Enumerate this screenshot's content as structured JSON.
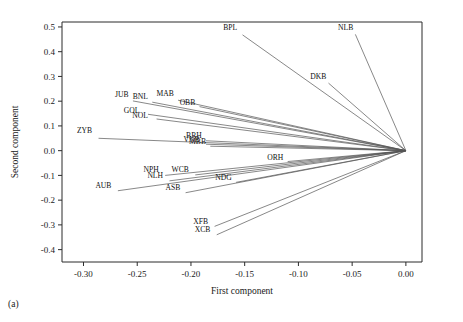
{
  "figure": {
    "panel_label": "(a)"
  },
  "chart_data": {
    "type": "scatter",
    "subtype": "pca-loading-biplot",
    "title": "",
    "xlabel": "First component",
    "ylabel": "Second component",
    "xlim": [
      -0.32,
      0.015
    ],
    "ylim": [
      -0.45,
      0.52
    ],
    "grid": false,
    "legend": null,
    "origin": [
      0.0,
      0.0
    ],
    "xticks": [
      "-0.30",
      "-0.25",
      "-0.20",
      "-0.15",
      "-0.10",
      "-0.05",
      "0.00"
    ],
    "xtickvalues": [
      -0.3,
      -0.25,
      -0.2,
      -0.15,
      -0.1,
      -0.05,
      0.0
    ],
    "yticks": [
      "0.5",
      "0.4",
      "0.3",
      "0.2",
      "0.1",
      "0.0",
      "-0.1",
      "-0.2",
      "-0.3",
      "-0.4"
    ],
    "ytickvalues": [
      0.5,
      0.4,
      0.3,
      0.2,
      0.1,
      0.0,
      -0.1,
      -0.2,
      -0.3,
      -0.4
    ],
    "points": [
      {
        "label": "BPL",
        "x": -0.152,
        "y": 0.468,
        "lx": -0.157,
        "ly": 0.487
      },
      {
        "label": "NLB",
        "x": -0.047,
        "y": 0.47,
        "lx": -0.049,
        "ly": 0.489
      },
      {
        "label": "DKB",
        "x": -0.072,
        "y": 0.273,
        "lx": -0.074,
        "ly": 0.29
      },
      {
        "label": "JUB",
        "x": -0.254,
        "y": 0.201,
        "lx": -0.258,
        "ly": 0.218
      },
      {
        "label": "BNL",
        "x": -0.236,
        "y": 0.196,
        "lx": -0.24,
        "ly": 0.208
      },
      {
        "label": "MAB",
        "x": -0.212,
        "y": 0.204,
        "lx": -0.216,
        "ly": 0.219
      },
      {
        "label": "OBB",
        "x": -0.192,
        "y": 0.178,
        "lx": -0.196,
        "ly": 0.186
      },
      {
        "label": "GOL",
        "x": -0.24,
        "y": 0.147,
        "lx": -0.248,
        "ly": 0.152
      },
      {
        "label": "NOL",
        "x": -0.232,
        "y": 0.128,
        "lx": -0.24,
        "ly": 0.134
      },
      {
        "label": "ZYB",
        "x": -0.286,
        "y": 0.05,
        "lx": -0.292,
        "ly": 0.072
      },
      {
        "label": "BRH",
        "x": -0.186,
        "y": 0.04,
        "lx": -0.19,
        "ly": 0.052
      },
      {
        "label": "VNB",
        "x": -0.186,
        "y": 0.026,
        "lx": -0.192,
        "ly": 0.036
      },
      {
        "label": "MBB",
        "x": -0.182,
        "y": 0.018,
        "lx": -0.186,
        "ly": 0.026
      },
      {
        "label": "ORH",
        "x": -0.11,
        "y": -0.044,
        "lx": -0.114,
        "ly": -0.036
      },
      {
        "label": "NPH",
        "x": -0.224,
        "y": -0.1,
        "lx": -0.23,
        "ly": -0.088
      },
      {
        "label": "WCB",
        "x": -0.196,
        "y": -0.098,
        "lx": -0.202,
        "ly": -0.086
      },
      {
        "label": "NLH",
        "x": -0.22,
        "y": -0.122,
        "lx": -0.226,
        "ly": -0.11
      },
      {
        "label": "NDG",
        "x": -0.158,
        "y": -0.128,
        "lx": -0.162,
        "ly": -0.12
      },
      {
        "label": "AUB",
        "x": -0.268,
        "y": -0.162,
        "lx": -0.274,
        "ly": -0.152
      },
      {
        "label": "ASB",
        "x": -0.205,
        "y": -0.17,
        "lx": -0.21,
        "ly": -0.16
      },
      {
        "label": "XFB",
        "x": -0.178,
        "y": -0.306,
        "lx": -0.184,
        "ly": -0.296
      },
      {
        "label": "XCB",
        "x": -0.176,
        "y": -0.34,
        "lx": -0.182,
        "ly": -0.33
      }
    ]
  }
}
